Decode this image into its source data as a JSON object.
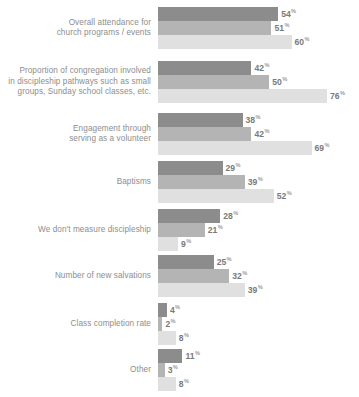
{
  "chart_data": {
    "type": "bar",
    "orientation": "horizontal",
    "title": "",
    "subtitle": "",
    "xlabel": "",
    "ylabel": "",
    "grid": false,
    "legend_position": "none",
    "value_suffix": "%",
    "xlim": [
      0,
      80
    ],
    "categories": [
      "Overall attendance for\nchurch programs / events",
      "Proportion of congregation involved\nin discipleship pathways such as small\ngroups, Sunday school classes, etc.",
      "Engagement through\nserving as a volunteer",
      "Baptisms",
      "We don't measure discipleship",
      "Number of new salvations",
      "Class completion rate",
      "Other"
    ],
    "series": [
      {
        "name": "series-1",
        "color": "#8c8c8c",
        "values": [
          54,
          42,
          38,
          29,
          28,
          25,
          4,
          11
        ]
      },
      {
        "name": "series-2",
        "color": "#b4b4b4",
        "values": [
          51,
          50,
          42,
          39,
          21,
          32,
          2,
          3
        ]
      },
      {
        "name": "series-3",
        "color": "#e0e0e0",
        "values": [
          60,
          76,
          69,
          52,
          9,
          39,
          8,
          8
        ]
      }
    ],
    "value_labels": [
      [
        "54%",
        "51%",
        "60%"
      ],
      [
        "42%",
        "50%",
        "76%"
      ],
      [
        "38%",
        "42%",
        "69%"
      ],
      [
        "29%",
        "39%",
        "52%"
      ],
      [
        "28%",
        "21%",
        "9%"
      ],
      [
        "25%",
        "32%",
        "39%"
      ],
      [
        "4%",
        "2%",
        "8%"
      ],
      [
        "11%",
        "3%",
        "8%"
      ]
    ]
  },
  "footnote": {
    "text": ""
  },
  "colors": {
    "background": "#ffffff",
    "label_text": "#8d8d8d",
    "value_text": "#7a7a7a",
    "series_1": "#8c8c8c",
    "series_2": "#b4b4b4",
    "series_3": "#e0e0e0"
  }
}
